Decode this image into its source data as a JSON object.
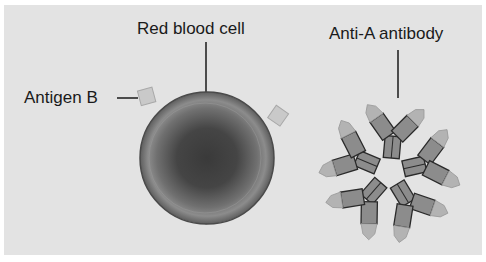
{
  "diagram": {
    "labels": {
      "red_blood_cell": "Red blood cell",
      "antigen": "Antigen B",
      "antibody": "Anti-A antibody"
    },
    "colors": {
      "background": "#e3e3e3",
      "border": "#ffffff",
      "cell_outer": "#8a8a8a",
      "cell_inner": "#3a3a3a",
      "antigen_fill": "#c9c9c9",
      "antibody_body": "#8c8c8c",
      "antibody_tip": "#b3b3b3",
      "outline": "#2a2a2a"
    },
    "elements": {
      "red_blood_cell": {
        "cx": 207,
        "cy": 158,
        "r": 67
      },
      "antigens": [
        {
          "x": 147,
          "y": 97
        },
        {
          "x": 278,
          "y": 116
        },
        {
          "x": 206,
          "y": 213
        }
      ],
      "antibody_cluster": {
        "cx": 390,
        "cy": 172,
        "count": 5
      }
    }
  }
}
